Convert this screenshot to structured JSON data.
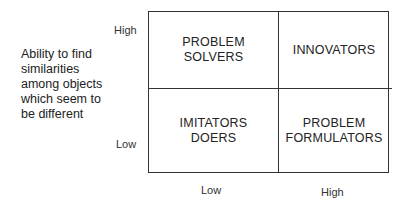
{
  "y_axis": {
    "label": "Ability to find similarities among objects which seem to be different",
    "label_lines": [
      "Ability to find",
      "similarities",
      "among objects",
      "which seem to",
      "be different"
    ],
    "ticks": {
      "high": "High",
      "low": "Low"
    }
  },
  "x_axis": {
    "label": "",
    "ticks": {
      "low": "Low",
      "high": "High"
    }
  },
  "quadrants": {
    "top_left": {
      "lines": [
        "PROBLEM",
        "SOLVERS"
      ]
    },
    "top_right": {
      "lines": [
        "INNOVATORS"
      ]
    },
    "bottom_left": {
      "lines": [
        "IMITATORS",
        "DOERS"
      ]
    },
    "bottom_right": {
      "lines": [
        "PROBLEM",
        "FORMULATORS"
      ]
    }
  }
}
